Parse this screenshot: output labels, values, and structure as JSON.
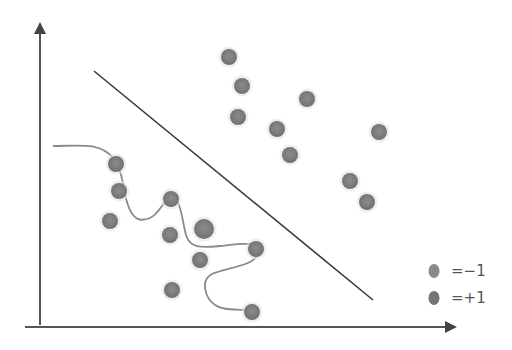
{
  "diagram": {
    "type": "classification-boundary-illustration",
    "point_color": "#7a7a7a",
    "line_color": "#3a3a3a",
    "curve_color": "#8a8a8a",
    "axes": {
      "y_axis": {
        "x1": 40,
        "y1": 325,
        "x2": 40,
        "y2": 25
      },
      "x_axis": {
        "x1": 25,
        "y1": 327,
        "x2": 455,
        "y2": 327
      }
    },
    "linear_boundary": {
      "x1": 94,
      "y1": 71,
      "x2": 373,
      "y2": 300
    },
    "nonlinear_boundary_path": "M 53 146 C 80 146, 100 142, 113 158 C 125 175, 122 190, 128 205 C 133 220, 140 222, 150 218 C 160 214, 165 196, 173 198 C 181 200, 182 220, 186 235 C 190 248, 200 248, 220 246 C 240 244, 262 240, 258 254 C 254 266, 225 268, 212 274 C 200 280, 205 298, 215 305 C 225 312, 240 308, 251 311",
    "points": [
      {
        "x": 229,
        "y": 57,
        "r": 8
      },
      {
        "x": 242,
        "y": 86,
        "r": 8
      },
      {
        "x": 307,
        "y": 99,
        "r": 8
      },
      {
        "x": 238,
        "y": 117,
        "r": 8
      },
      {
        "x": 277,
        "y": 129,
        "r": 8
      },
      {
        "x": 379,
        "y": 132,
        "r": 8
      },
      {
        "x": 290,
        "y": 155,
        "r": 8
      },
      {
        "x": 350,
        "y": 181,
        "r": 8
      },
      {
        "x": 367,
        "y": 202,
        "r": 8
      },
      {
        "x": 116,
        "y": 164,
        "r": 8
      },
      {
        "x": 119,
        "y": 191,
        "r": 8
      },
      {
        "x": 171,
        "y": 199,
        "r": 8
      },
      {
        "x": 110,
        "y": 221,
        "r": 8
      },
      {
        "x": 170,
        "y": 235,
        "r": 8
      },
      {
        "x": 204,
        "y": 229,
        "r": 10
      },
      {
        "x": 256,
        "y": 249,
        "r": 8
      },
      {
        "x": 200,
        "y": 260,
        "r": 8
      },
      {
        "x": 172,
        "y": 290,
        "r": 8
      },
      {
        "x": 252,
        "y": 312,
        "r": 8
      }
    ],
    "legend": [
      {
        "label": "=−1",
        "marker_x": 434,
        "marker_y": 271,
        "label_x": 451,
        "label_y": 262
      },
      {
        "label": "=+1",
        "marker_x": 434,
        "marker_y": 298,
        "label_x": 451,
        "label_y": 289
      }
    ]
  }
}
